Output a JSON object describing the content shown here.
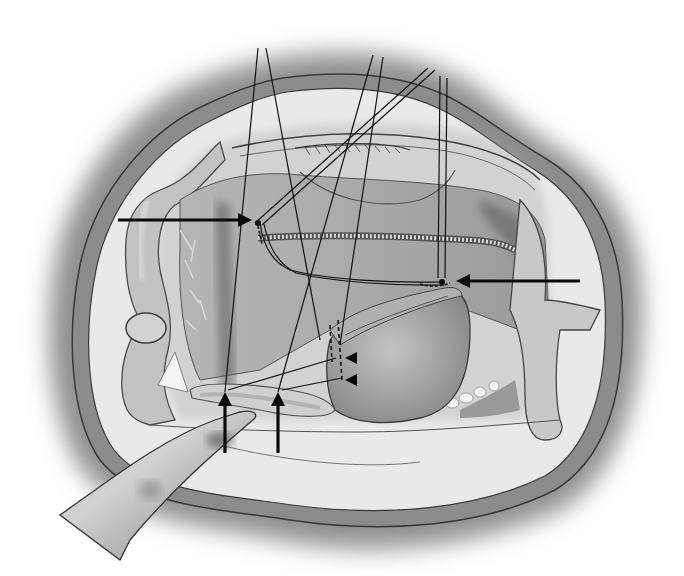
{
  "illustration": {
    "type": "surgical-illustration",
    "style": "grayscale pencil/airbrush drawing",
    "colors": {
      "background": "#ffffff",
      "halo": "#9a9a9a",
      "outer_ring": "#8c8c8c",
      "ring_outline": "#3a3a3a",
      "field": "#e6e6e6",
      "tissue": "#b8b8b8",
      "tissue_dark": "#7a7a7a",
      "suture": "#111111",
      "arrow": "#0a0a0a",
      "teeth": "#f4f4f4"
    },
    "arrows": [
      {
        "id": "left-horizontal-arrow",
        "from": [
          118,
          220
        ],
        "to": [
          253,
          220
        ],
        "direction": "right"
      },
      {
        "id": "right-horizontal-arrow",
        "from": [
          580,
          281
        ],
        "to": [
          456,
          281
        ],
        "direction": "left"
      },
      {
        "id": "bottom-arrow-1",
        "from": [
          225,
          453
        ],
        "to": [
          225,
          392
        ],
        "direction": "up"
      },
      {
        "id": "bottom-arrow-2",
        "from": [
          278,
          453
        ],
        "to": [
          278,
          392
        ],
        "direction": "up"
      }
    ],
    "arrowheads": [
      {
        "id": "small-arrowhead-upper",
        "at": [
          352,
          358
        ],
        "direction": "left"
      },
      {
        "id": "small-arrowhead-lower",
        "at": [
          352,
          380
        ],
        "direction": "left"
      }
    ],
    "sutures_count": 8
  }
}
